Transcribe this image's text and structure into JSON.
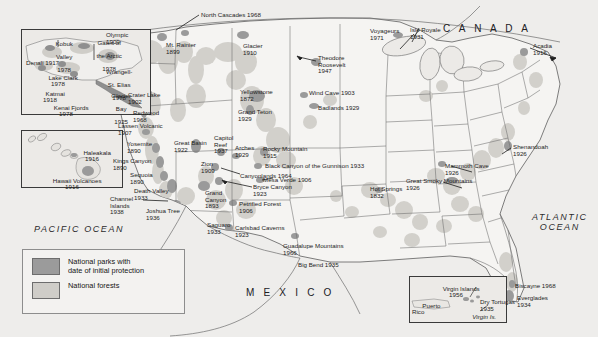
{
  "map": {
    "title": "United States National Parks and National Forests",
    "width": 598,
    "height": 337,
    "colors": {
      "ocean": "#eeedeb",
      "land": "#f4f3f1",
      "national_park": "#9b9b9b",
      "national_forest": "#cfcdc8",
      "border": "#6e6e6e",
      "text": "#1d1d1d"
    }
  },
  "legend": {
    "park_label": "National parks with\ndate of initial protection",
    "park_label_line1": "National parks with",
    "park_label_line2": "date of initial protection",
    "forest_label": "National forests",
    "park_color": "#9b9b9b",
    "forest_color": "#cfcdc8"
  },
  "regions": {
    "canada": "C A N A D A",
    "mexico": "M E X I C O",
    "pacific_ocean": "PACIFIC OCEAN",
    "atlantic_ocean": "ATLANTIC OCEAN",
    "atlantic_line1": "ATLANTIC",
    "atlantic_line2": "OCEAN"
  },
  "insets": {
    "alaska": {
      "name": "Alaska inset",
      "parks": [
        {
          "name": "Kobuk\nValley",
          "line1": "Kobuk",
          "line2": "Valley",
          "year": "1978"
        },
        {
          "name": "Gates of\nthe Arctic",
          "line1": "Gates of",
          "line2": "the Arctic",
          "year": "1978"
        },
        {
          "name": "Denali",
          "year": "1917",
          "label": "Denali 1917"
        },
        {
          "name": "Lake Clark",
          "year": "1978",
          "label": "Lake Clark"
        },
        {
          "name": "Wrangell-\nSt. Elias",
          "line1": "Wrangell-",
          "line2": "St. Elias",
          "year": "1978"
        },
        {
          "name": "Katmai",
          "year": "1918"
        },
        {
          "name": "Kenai Fjords",
          "year": "1978"
        },
        {
          "name": "Glacier\nBay",
          "line1": "Glacier",
          "line2": "Bay",
          "year": "1925"
        }
      ]
    },
    "hawaii": {
      "name": "Hawaii inset",
      "parks": [
        {
          "name": "Haleakala",
          "year": "1916"
        },
        {
          "name": "Hawaii Volcanoes",
          "year": "1916"
        }
      ]
    },
    "caribbean": {
      "name": "Puerto Rico and Virgin Islands inset",
      "parks": [
        {
          "name": "Virgin Islands",
          "year": "1956"
        }
      ],
      "places": [
        "Puerto\nRico",
        "Virgin Is."
      ],
      "puerto_rico_line1": "Puerto",
      "puerto_rico_line2": "Rico",
      "virgin_is": "Virgin Is."
    }
  },
  "parks": [
    {
      "id": "north-cascades",
      "name": "North Cascades 1968",
      "x": 201,
      "y": 12,
      "align": "left",
      "leader": {
        "dx": 26,
        "dy": 14
      }
    },
    {
      "id": "olympic",
      "name": "Olympic",
      "year": "1909",
      "x": 106,
      "y": 32,
      "align": "left",
      "leader": {
        "dx": 26,
        "dy": 3
      }
    },
    {
      "id": "mt-rainier",
      "name": "Mt. Rainier",
      "year": "1899",
      "x": 166,
      "y": 42,
      "align": "left"
    },
    {
      "id": "glacier",
      "name": "Glacier",
      "year": "1910",
      "x": 243,
      "y": 43,
      "align": "left"
    },
    {
      "id": "theodore-roosevelt",
      "name": "Theodore\nRoosevelt",
      "line1": "Theodore",
      "line2": "Roosevelt",
      "year": "1947",
      "x": 318,
      "y": 55,
      "align": "left",
      "leader": {
        "dx": -18,
        "dy": 4
      }
    },
    {
      "id": "voyageurs",
      "name": "Voyageurs",
      "year": "1971",
      "x": 370,
      "y": 28,
      "align": "left"
    },
    {
      "id": "isle-royale",
      "name": "Isle Royale",
      "year": "1931",
      "x": 410,
      "y": 27,
      "align": "left",
      "leader": {
        "dx": -6,
        "dy": 22
      }
    },
    {
      "id": "acadia",
      "name": "Acadia",
      "year": "1916",
      "x": 533,
      "y": 43,
      "align": "left",
      "leader": {
        "dx": 26,
        "dy": 7
      }
    },
    {
      "id": "crater-lake",
      "name": "Crater Lake",
      "year": "1902",
      "x": 128,
      "y": 92,
      "align": "left"
    },
    {
      "id": "redwood",
      "name": "Redwood",
      "year": "1968",
      "x": 133,
      "y": 110,
      "align": "left"
    },
    {
      "id": "lassen-volcanic",
      "name": "Lassen Volcanic",
      "year": "1907",
      "x": 118,
      "y": 123,
      "align": "left"
    },
    {
      "id": "yosemite",
      "name": "Yosemite",
      "year": "1890",
      "x": 127,
      "y": 141,
      "align": "left"
    },
    {
      "id": "kings-canyon",
      "name": "Kings Canyon",
      "year": "1890",
      "x": 113,
      "y": 158,
      "align": "left"
    },
    {
      "id": "sequoia",
      "name": "Sequoia",
      "year": "1890",
      "x": 130,
      "y": 172,
      "align": "left"
    },
    {
      "id": "death-valley",
      "name": "Death Valley",
      "year": "1933",
      "x": 134,
      "y": 188,
      "align": "left"
    },
    {
      "id": "channel-islands",
      "name": "Channel\nIslands",
      "line1": "Channel",
      "line2": "Islands",
      "year": "1938",
      "x": 110,
      "y": 196,
      "align": "left",
      "leader": {
        "dx": 34,
        "dy": 4
      }
    },
    {
      "id": "joshua-tree",
      "name": "Joshua Tree",
      "year": "1936",
      "x": 146,
      "y": 208,
      "align": "left"
    },
    {
      "id": "great-basin",
      "name": "Great Basin",
      "year": "1922",
      "x": 174,
      "y": 140,
      "align": "left"
    },
    {
      "id": "capitol-reef",
      "name": "Capitol\nReef",
      "line1": "Capitol",
      "line2": "Reef",
      "year": "1937",
      "x": 214,
      "y": 135,
      "align": "left"
    },
    {
      "id": "arches",
      "name": "Arches",
      "year": "1929",
      "x": 235,
      "y": 145,
      "align": "left"
    },
    {
      "id": "zion",
      "name": "Zion",
      "year": "1909",
      "x": 201,
      "y": 161,
      "align": "left",
      "leader": {
        "dx": 24,
        "dy": 6
      }
    },
    {
      "id": "bryce-canyon",
      "name": "Bryce Canyon",
      "year": "1923",
      "x": 253,
      "y": 184,
      "align": "left",
      "leader": {
        "dx": -36,
        "dy": 10
      }
    },
    {
      "id": "grand-canyon",
      "name": "Grand\nCanyon",
      "line1": "Grand",
      "line2": "Canyon",
      "year": "1893",
      "x": 205,
      "y": 190,
      "align": "left"
    },
    {
      "id": "petrified-forest",
      "name": "Petrified Forest",
      "year": "1906",
      "x": 239,
      "y": 201,
      "align": "left"
    },
    {
      "id": "saguaro",
      "name": "Saguaro",
      "year": "1933",
      "x": 207,
      "y": 222,
      "align": "left"
    },
    {
      "id": "yellowstone",
      "name": "Yellowstone",
      "year": "1872",
      "x": 240,
      "y": 89,
      "align": "left"
    },
    {
      "id": "grand-teton",
      "name": "Grand Teton",
      "year": "1929",
      "x": 238,
      "y": 109,
      "align": "left"
    },
    {
      "id": "rocky-mountain",
      "name": "Rocky Mountain",
      "year": "1915",
      "x": 263,
      "y": 146,
      "align": "left"
    },
    {
      "id": "black-canyon",
      "name": "Black Canyon of the Gunnison 1933",
      "x": 265,
      "y": 163,
      "align": "left"
    },
    {
      "id": "canyonlands",
      "name": "Canyonlands 1964",
      "x": 240,
      "y": 173,
      "align": "left"
    },
    {
      "id": "mesa-verde",
      "name": "Mesa Verde 1906",
      "x": 263,
      "y": 177,
      "align": "left"
    },
    {
      "id": "wind-cave",
      "name": "Wind Cave 1903",
      "x": 309,
      "y": 90,
      "align": "left"
    },
    {
      "id": "badlands",
      "name": "Badlands 1929",
      "x": 318,
      "y": 105,
      "align": "left"
    },
    {
      "id": "carlsbad-caverns",
      "name": "Carlsbad Caverns",
      "year": "1923",
      "x": 235,
      "y": 225,
      "align": "left"
    },
    {
      "id": "guadalupe-mountains",
      "name": "Guadalupe Mountains",
      "year": "1966",
      "x": 283,
      "y": 243,
      "align": "left"
    },
    {
      "id": "big-bend",
      "name": "Big Bend 1935",
      "x": 298,
      "y": 262,
      "align": "left"
    },
    {
      "id": "hot-springs",
      "name": "Hot Springs",
      "year": "1832",
      "x": 370,
      "y": 186,
      "align": "left"
    },
    {
      "id": "great-smoky-mountains",
      "name": "Great Smoky Mountains",
      "year": "1926",
      "x": 406,
      "y": 178,
      "align": "left"
    },
    {
      "id": "mammoth-cave",
      "name": "Mammoth Cave",
      "year": "1926",
      "x": 445,
      "y": 163,
      "align": "left"
    },
    {
      "id": "shenandoah",
      "name": "Shenandoah",
      "year": "1926",
      "x": 513,
      "y": 144,
      "align": "left"
    },
    {
      "id": "biscayne",
      "name": "Biscayne 1968",
      "x": 515,
      "y": 283,
      "align": "left"
    },
    {
      "id": "everglades",
      "name": "Everglades",
      "year": "1934",
      "x": 517,
      "y": 295,
      "align": "left"
    },
    {
      "id": "dry-tortugas",
      "name": "Dry Tortugas",
      "year": "1935",
      "x": 480,
      "y": 299,
      "align": "left"
    }
  ]
}
